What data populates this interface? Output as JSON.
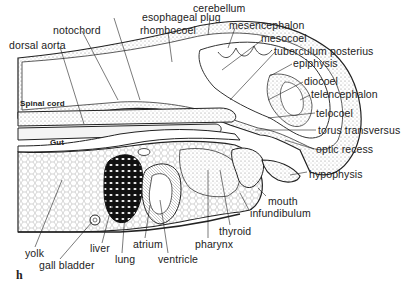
{
  "figure": {
    "panel_label": "h",
    "inner_labels": {
      "spinal_cord": "Spinal cord",
      "gut": "Gut"
    },
    "labels": [
      {
        "id": "esophageal-plug",
        "text": "esophageal plug",
        "x": 142,
        "y": 12
      },
      {
        "id": "cerebellum",
        "text": "cerebellum",
        "x": 193,
        "y": 11
      },
      {
        "id": "notochord",
        "text": "notochord",
        "x": 53,
        "y": 25
      },
      {
        "id": "rhombocoel",
        "text": "rhombocoel",
        "x": 140,
        "y": 25
      },
      {
        "id": "mesencephalon",
        "text": "mesencephalon",
        "x": 229,
        "y": 21
      },
      {
        "id": "mesocoel",
        "text": "mesocoel",
        "x": 261,
        "y": 34
      },
      {
        "id": "dorsal-aorta",
        "text": "dorsal aorta",
        "x": 9,
        "y": 40
      },
      {
        "id": "tuberculum-posterius",
        "text": "tuberculum posterius",
        "x": 274,
        "y": 46
      },
      {
        "id": "epiphysis",
        "text": "epiphysis",
        "x": 293,
        "y": 58
      },
      {
        "id": "diocoel",
        "text": "diocoel",
        "x": 304,
        "y": 76
      },
      {
        "id": "telencephalon",
        "text": "telencephalon",
        "x": 311,
        "y": 89
      },
      {
        "id": "telocoel",
        "text": "telocoel",
        "x": 316,
        "y": 108
      },
      {
        "id": "torus-transversus",
        "text": "torus transversus",
        "x": 318,
        "y": 125
      },
      {
        "id": "optic-recess",
        "text": "optic recess",
        "x": 316,
        "y": 144
      },
      {
        "id": "hypophysis",
        "text": "hypophysis",
        "x": 309,
        "y": 169
      },
      {
        "id": "mouth",
        "text": "mouth",
        "x": 268,
        "y": 196
      },
      {
        "id": "infundibulum",
        "text": "infundibulum",
        "x": 250,
        "y": 208
      },
      {
        "id": "thyroid",
        "text": "thyroid",
        "x": 219,
        "y": 226
      },
      {
        "id": "pharynx",
        "text": "pharynx",
        "x": 195,
        "y": 239
      },
      {
        "id": "atrium",
        "text": "atrium",
        "x": 133,
        "y": 239
      },
      {
        "id": "liver",
        "text": "liver",
        "x": 90,
        "y": 243
      },
      {
        "id": "ventricle",
        "text": "ventricle",
        "x": 158,
        "y": 254
      },
      {
        "id": "lung",
        "text": "lung",
        "x": 115,
        "y": 254
      },
      {
        "id": "yolk",
        "text": "yolk",
        "x": 25,
        "y": 248
      },
      {
        "id": "gall-bladder",
        "text": "gall bladder",
        "x": 39,
        "y": 260
      }
    ]
  }
}
